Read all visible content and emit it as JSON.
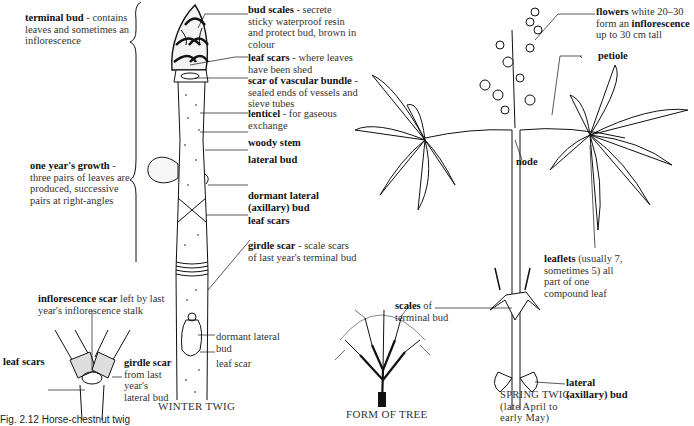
{
  "figure": {
    "caption_partial": "Fig. 2.12 Horse-chestnut twig",
    "colors": {
      "ink": "#111111",
      "label": "#333333",
      "background": "#ffffff"
    }
  },
  "winter_twig": {
    "caption": "WINTER TWIG",
    "labels": {
      "terminal_bud": {
        "term": "terminal bud",
        "desc": " - contains leaves and sometimes an inflorescence"
      },
      "one_years_growth": {
        "term": "one year's growth",
        "desc": " - three pairs of leaves are produced, successive pairs at right-angles"
      },
      "bud_scales": {
        "term": "bud scales",
        "desc": " - secrete sticky waterproof resin and protect bud, brown in colour"
      },
      "leaf_scars_top": {
        "term": "leaf scars",
        "desc": " - where leaves have been shed"
      },
      "scar_vascular_bundle": {
        "term": "scar of vascular bundle",
        "desc": " - sealed ends of vessels and sieve tubes"
      },
      "lenticel": {
        "term": "lenticel",
        "desc": " - for gaseous exchange"
      },
      "woody_stem": {
        "term": "woody stem"
      },
      "lateral_bud": {
        "term": "lateral bud"
      },
      "dormant_lateral_bud": {
        "term": "dormant lateral (axillary) bud"
      },
      "leaf_scars_mid": {
        "term": "leaf scars"
      },
      "girdle_scar": {
        "term": "girdle scar",
        "desc": " - scale scars of last year's terminal bud"
      },
      "dormant_lateral_bud_low": {
        "desc": "dormant lateral bud"
      },
      "leaf_scar_low": {
        "desc": "leaf scar"
      }
    }
  },
  "branch_detail": {
    "labels": {
      "inflorescence_scar": {
        "term": "inflorescence scar",
        "desc": " left by last year's inflorescence stalk"
      },
      "leaf_scars": {
        "term": "leaf scars"
      },
      "girdle_scar": {
        "term": "girdle scar",
        "desc": " from last year's lateral bud"
      }
    }
  },
  "form_of_tree": {
    "caption": "FORM OF TREE"
  },
  "spring_twig": {
    "caption_line1": "SPRING TWIG",
    "caption_line2": "(late April to",
    "caption_line3": "early May)",
    "labels": {
      "flowers": {
        "term": "flowers",
        "desc": " white 20–30 form an ",
        "term2": "inflorescence",
        "desc2": " up to 30 cm tall"
      },
      "petiole": {
        "term": "petiole"
      },
      "node": {
        "term": "node"
      },
      "scales_terminal_bud": {
        "term": "scales",
        "desc": " of terminal bud"
      },
      "leaflets": {
        "term": "leaflets",
        "desc": " (usually 7, sometimes 5) all part of one compound leaf"
      },
      "lateral_axillary_bud": {
        "term": "lateral (axillary) bud"
      }
    }
  }
}
